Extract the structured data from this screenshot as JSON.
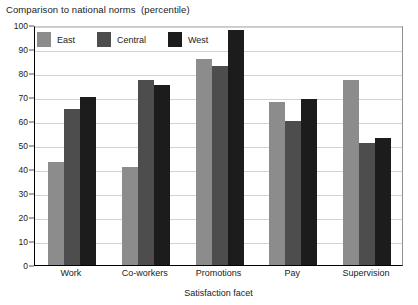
{
  "chart_data": {
    "type": "bar",
    "title": "Comparison to national norms  (percentile)",
    "xlabel": "Satisfaction facet",
    "ylabel": "",
    "ylim": [
      0,
      100
    ],
    "ytick_step": 10,
    "yticks": [
      "100",
      "90",
      "80",
      "70",
      "60",
      "50",
      "40",
      "30",
      "20",
      "10",
      "0"
    ],
    "grid": true,
    "legend_position": "top-left-inside",
    "categories": [
      "Work",
      "Co-workers",
      "Promotions",
      "Pay",
      "Supervision"
    ],
    "series": [
      {
        "name": "East",
        "color": "#8c8c8c",
        "values": [
          43,
          41,
          86,
          68,
          77
        ]
      },
      {
        "name": "Central",
        "color": "#4d4d4d",
        "values": [
          65,
          77,
          83,
          60,
          51
        ]
      },
      {
        "name": "West",
        "color": "#1c1c1c",
        "values": [
          70,
          75,
          98,
          69,
          53
        ]
      }
    ]
  }
}
